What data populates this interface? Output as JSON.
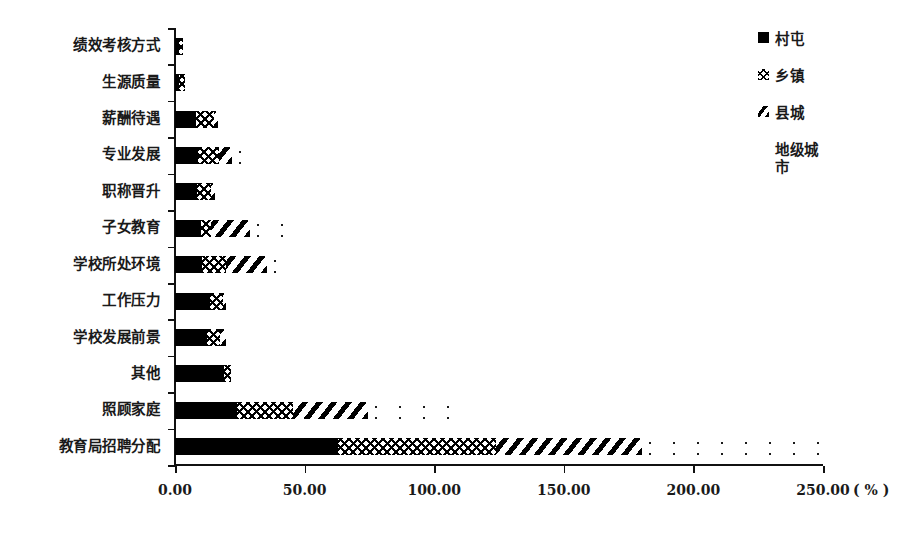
{
  "chart_data": {
    "type": "bar",
    "orientation": "horizontal",
    "stacked": true,
    "title": "",
    "subtitle": "",
    "xlabel": "(%)",
    "ylabel": "",
    "xlim": [
      0,
      250
    ],
    "xticks": [
      0,
      50,
      100,
      150,
      200,
      250
    ],
    "xtick_labels": [
      "0.00",
      "50.00",
      "100.00",
      "150.00",
      "200.00",
      "250.00"
    ],
    "x_unit_label": "( % )",
    "grid": false,
    "legend_position": "right",
    "categories": [
      "绩效考核方式",
      "生源质量",
      "薪酬待遇",
      "专业发展",
      "职称晋升",
      "子女教育",
      "学校所处环境",
      "工作压力",
      "学校发展前景",
      "其他",
      "照顾家庭",
      "教育局招聘分配"
    ],
    "series": [
      {
        "name": "村屯",
        "pattern": "solid",
        "values": [
          1.5,
          1.5,
          8.0,
          9.0,
          8.5,
          10.0,
          10.5,
          13.5,
          12.5,
          19.0,
          24.0,
          63.0
        ]
      },
      {
        "name": "乡镇",
        "pattern": "crosshatch",
        "values": [
          1.5,
          2.5,
          7.0,
          8.0,
          5.5,
          4.0,
          9.0,
          5.0,
          5.0,
          2.5,
          21.5,
          61.0
        ]
      },
      {
        "name": "县城",
        "pattern": "diagonal",
        "values": [
          0.0,
          0.0,
          1.5,
          5.0,
          1.5,
          15.0,
          16.0,
          1.0,
          2.0,
          0.0,
          29.0,
          56.0
        ]
      },
      {
        "name": "地级城市",
        "pattern": "dots",
        "values": [
          0.0,
          0.0,
          0.0,
          7.0,
          0.0,
          21.0,
          9.0,
          0.0,
          2.5,
          0.0,
          31.5,
          70.0
        ]
      }
    ],
    "totals": [
      3.0,
      4.0,
      16.5,
      29.0,
      15.5,
      50.0,
      44.5,
      19.5,
      22.0,
      21.5,
      106.0,
      250.0
    ]
  },
  "legend": {
    "items": [
      {
        "label": "村屯",
        "swatch": "sw-solid"
      },
      {
        "label": "乡镇",
        "swatch": "sw-cross"
      },
      {
        "label": "县城",
        "swatch": "sw-diag"
      },
      {
        "label": "地级城\n市",
        "swatch": "empty"
      }
    ]
  }
}
